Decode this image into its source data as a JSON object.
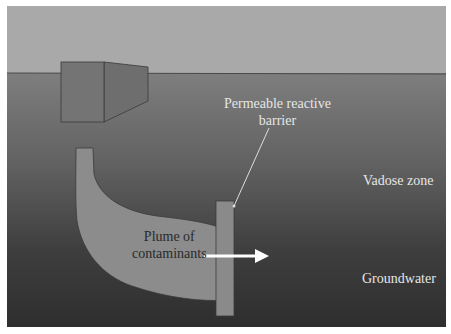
{
  "diagram": {
    "labels": {
      "barrier_line1": "Permeable reactive",
      "barrier_line2": "barrier",
      "vadose": "Vadose zone",
      "plume_line1": "Plume of",
      "plume_line2": "contaminants",
      "groundwater": "Groundwater"
    },
    "colors": {
      "sky": "#a9a9a9",
      "vadose_top": "#7f7f7f",
      "groundwater_bottom": "#2f2f2f",
      "plume": "#8c8c8c",
      "barrier": "#8a8a8a",
      "arrow": "#ffffff",
      "text_light": "#e6e6e6",
      "text_dark": "#2a2a2a"
    }
  }
}
